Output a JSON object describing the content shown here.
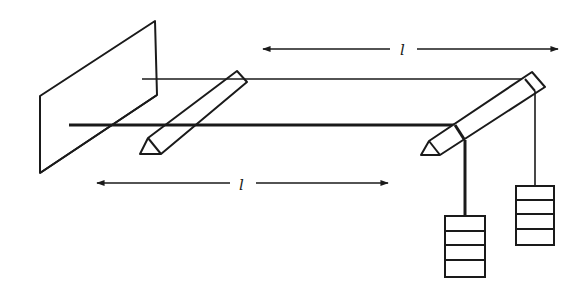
{
  "diagram": {
    "type": "physics-apparatus",
    "colors": {
      "ink": "#1a1a1a",
      "background": "#ffffff"
    },
    "labels": {
      "top_length": "l",
      "bottom_length": "l"
    },
    "components": {
      "plate": "vertical-plate",
      "wires": [
        "thin-wire",
        "thick-wire"
      ],
      "supports": [
        "left-knife-edge",
        "right-knife-edge"
      ],
      "weights": [
        {
          "name": "weight-stack-thick-wire",
          "blocks": 4
        },
        {
          "name": "weight-stack-thin-wire",
          "blocks": 4
        }
      ]
    }
  }
}
